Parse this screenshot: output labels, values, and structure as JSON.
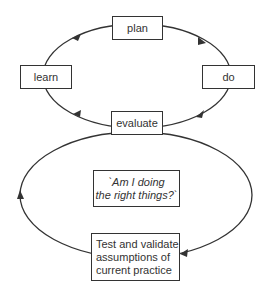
{
  "diagram": {
    "upper_cycle": {
      "nodes": {
        "plan": "plan",
        "do": "do",
        "evaluate": "evaluate",
        "learn": "learn"
      },
      "direction": "clockwise"
    },
    "lower_cycle": {
      "question_line1": "`Am I doing",
      "question_line2": "the right things?`",
      "test_line1": "Test and validate",
      "test_line2": "assumptions of",
      "test_line3": "current practice",
      "direction": "clockwise"
    },
    "colors": {
      "line": "#333333",
      "box_border": "#333333",
      "text": "#333333",
      "background": "#ffffff"
    }
  }
}
